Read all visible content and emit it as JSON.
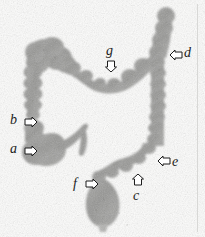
{
  "figure": {
    "modality": "radiograph",
    "background_color": "#fdfdfc",
    "structure_color": "#9a9a9a",
    "label_color": "#1c1c1c"
  },
  "labels": [
    {
      "key": "a",
      "text": "a",
      "arrow_direction": "right",
      "x": 10,
      "y": 142,
      "arrow_x": 24,
      "arrow_y": 143
    },
    {
      "key": "b",
      "text": "b",
      "arrow_direction": "right",
      "x": 10,
      "y": 113,
      "arrow_x": 24,
      "arrow_y": 114
    },
    {
      "key": "c",
      "text": "c",
      "arrow_direction": "up",
      "x": 133,
      "y": 189,
      "arrow_x": 131,
      "arrow_y": 172
    },
    {
      "key": "d",
      "text": "d",
      "arrow_direction": "left",
      "x": 184,
      "y": 46,
      "arrow_x": 169,
      "arrow_y": 47
    },
    {
      "key": "e",
      "text": "e",
      "arrow_direction": "left",
      "x": 172,
      "y": 155,
      "arrow_x": 157,
      "arrow_y": 153
    },
    {
      "key": "f",
      "text": "f",
      "arrow_direction": "right",
      "x": 73,
      "y": 177,
      "arrow_x": 85,
      "arrow_y": 176
    },
    {
      "key": "g",
      "text": "g",
      "arrow_direction": "down",
      "x": 106,
      "y": 44,
      "arrow_x": 104,
      "arrow_y": 58
    }
  ],
  "edge_marker": {
    "name": "film-edge-line",
    "color": "#d8d8d6"
  }
}
